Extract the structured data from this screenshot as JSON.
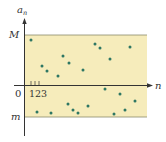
{
  "figure": {
    "y_axis_label_base": "a",
    "y_axis_label_sub": "n",
    "x_axis_label": "n",
    "upper_bound_label": "M",
    "lower_bound_label": "m",
    "origin_label": "0",
    "tick_labels": "123",
    "colors": {
      "band_fill": "#f6ecbb",
      "band_edge": "#8a8a6a",
      "axis": "#333333",
      "dot": "#2e7763"
    }
  },
  "chart_data": {
    "type": "scatter",
    "title": "",
    "xlabel": "n",
    "ylabel": "a_n",
    "bounds": {
      "upper": "M",
      "lower": "m"
    },
    "note": "All terms a_n lie in the shaded band m <= a_n <= M",
    "points_px": [
      [
        31,
        40
      ],
      [
        42,
        66
      ],
      [
        47,
        71
      ],
      [
        58,
        76
      ],
      [
        63,
        56
      ],
      [
        69,
        63
      ],
      [
        83,
        70
      ],
      [
        95,
        44
      ],
      [
        100,
        48
      ],
      [
        110,
        59
      ],
      [
        130,
        47
      ],
      [
        105,
        89
      ],
      [
        120,
        94
      ],
      [
        135,
        101
      ],
      [
        37,
        112
      ],
      [
        51,
        113
      ],
      [
        68,
        104
      ],
      [
        73,
        110
      ],
      [
        78,
        113
      ],
      [
        88,
        106
      ],
      [
        114,
        114
      ],
      [
        125,
        110
      ]
    ]
  }
}
